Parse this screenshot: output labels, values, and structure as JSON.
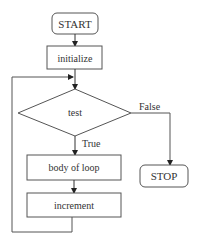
{
  "diagram": {
    "type": "flowchart",
    "nodes": {
      "start": {
        "label": "START",
        "shape": "rounded-rect"
      },
      "initialize": {
        "label": "initialize",
        "shape": "rect"
      },
      "test": {
        "label": "test",
        "shape": "diamond"
      },
      "body": {
        "label": "body of loop",
        "shape": "rect"
      },
      "increment": {
        "label": "increment",
        "shape": "rect"
      },
      "stop": {
        "label": "STOP",
        "shape": "rounded-rect"
      }
    },
    "edges": {
      "true_label": "True",
      "false_label": "False"
    },
    "colors": {
      "stroke": "#555555",
      "text": "#333333",
      "background": "#ffffff"
    }
  }
}
